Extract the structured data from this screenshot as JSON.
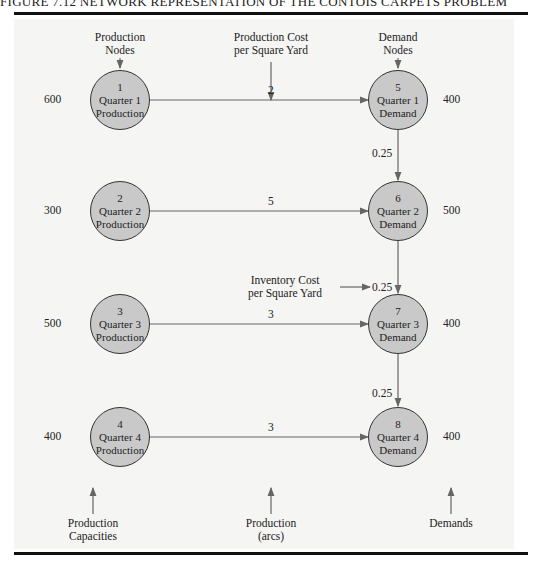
{
  "caption": "FIGURE 7.12   NETWORK REPRESENTATION OF THE CONTOIS CARPETS PROBLEM",
  "header_labels": {
    "production_nodes": [
      "Production",
      "Nodes"
    ],
    "production_cost": [
      "Production Cost",
      "per Square Yard"
    ],
    "demand_nodes": [
      "Demand",
      "Nodes"
    ],
    "inventory_cost": [
      "Inventory Cost",
      "per Square Yard"
    ]
  },
  "footer_labels": {
    "production_capacities": [
      "Production",
      "Capacities"
    ],
    "production_arcs": [
      "Production",
      "(arcs)"
    ],
    "demands": [
      "Demands"
    ]
  },
  "production_nodes": [
    {
      "id": "1",
      "line1": "Quarter 1",
      "line2": "Production",
      "capacity": "600"
    },
    {
      "id": "2",
      "line1": "Quarter 2",
      "line2": "Production",
      "capacity": "300"
    },
    {
      "id": "3",
      "line1": "Quarter 3",
      "line2": "Production",
      "capacity": "500"
    },
    {
      "id": "4",
      "line1": "Quarter 4",
      "line2": "Production",
      "capacity": "400"
    }
  ],
  "demand_nodes": [
    {
      "id": "5",
      "line1": "Quarter 1",
      "line2": "Demand",
      "demand": "400"
    },
    {
      "id": "6",
      "line1": "Quarter 2",
      "line2": "Demand",
      "demand": "500"
    },
    {
      "id": "7",
      "line1": "Quarter 3",
      "line2": "Demand",
      "demand": "400"
    },
    {
      "id": "8",
      "line1": "Quarter 4",
      "line2": "Demand",
      "demand": "400"
    }
  ],
  "production_arcs": [
    {
      "from": "1",
      "to": "5",
      "cost": "2"
    },
    {
      "from": "2",
      "to": "6",
      "cost": "5"
    },
    {
      "from": "3",
      "to": "7",
      "cost": "3"
    },
    {
      "from": "4",
      "to": "8",
      "cost": "3"
    }
  ],
  "inventory_arcs": [
    {
      "from": "5",
      "to": "6",
      "cost": "0.25"
    },
    {
      "from": "6",
      "to": "7",
      "cost": "0.25"
    },
    {
      "from": "7",
      "to": "8",
      "cost": "0.25"
    }
  ],
  "colors": {
    "node_fill": "#c9c9c9",
    "node_stroke": "#333333",
    "arc": "#666666",
    "rule": "#111111"
  }
}
